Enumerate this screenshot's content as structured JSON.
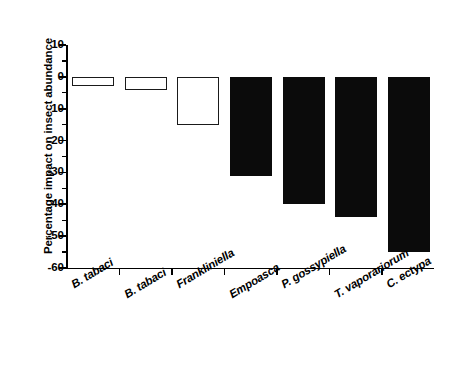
{
  "chart_data": {
    "type": "bar",
    "title": "",
    "xlabel": "",
    "ylabel": "Percentage impact on insect abundance",
    "categories": [
      "B. tabaci",
      "B. tabaci",
      "Frankliniella",
      "Empoasca",
      "P. gossypiella",
      "T. vaporariorum",
      "C. ectypa"
    ],
    "values": [
      -3,
      -4,
      -15,
      -31,
      -40,
      -44,
      -55
    ],
    "bar_styles": [
      "open",
      "open",
      "open",
      "filled",
      "filled",
      "filled",
      "filled"
    ],
    "ylim": [
      -60,
      10
    ],
    "ytick_labels": [
      "10",
      "0",
      "-10",
      "-20",
      "-30",
      "-40",
      "-50",
      "-60"
    ],
    "ytick_values": [
      10,
      0,
      -10,
      -20,
      -30,
      -40,
      -50,
      -60
    ],
    "yminor_values": [
      5,
      -5,
      -15,
      -25,
      -35,
      -45,
      -55
    ],
    "grid": false,
    "legend": "none",
    "colors": {
      "open_fill": "#ffffff",
      "open_edge": "#1a1a1a",
      "filled_fill": "#0b0b0b",
      "axis": "#000000",
      "background": "#ffffff"
    }
  }
}
